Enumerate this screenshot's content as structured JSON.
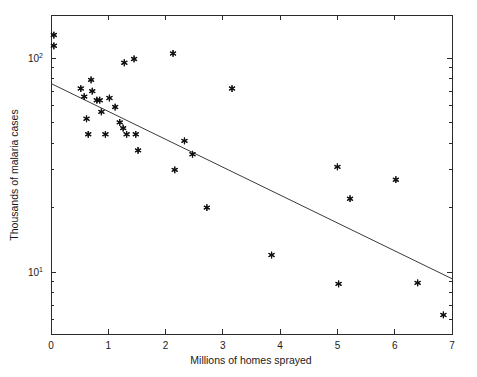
{
  "chart_data": {
    "type": "scatter",
    "title": "",
    "xlabel": "Millions of homes sprayed",
    "ylabel": "Thousands of malaria cases",
    "xlim": [
      0,
      7
    ],
    "ylim": [
      5.5,
      160
    ],
    "yscale": "log",
    "xscale": "linear",
    "grid": false,
    "legend": null,
    "marker_style": "asterisk",
    "xticks": [
      0,
      1,
      2,
      3,
      4,
      5,
      6,
      7
    ],
    "xticklabels": [
      "0",
      "1",
      "2",
      "3",
      "4",
      "5",
      "6",
      "7"
    ],
    "yticks": [
      10,
      100
    ],
    "yticklabels": [
      "10^1",
      "10^2"
    ],
    "ytick_mantissa": [
      "10",
      "10"
    ],
    "ytick_exponent": [
      "1",
      "2"
    ],
    "points": [
      {
        "x": 0.05,
        "y": 128.0
      },
      {
        "x": 0.05,
        "y": 114.0
      },
      {
        "x": 0.52,
        "y": 72.0
      },
      {
        "x": 0.58,
        "y": 66.0
      },
      {
        "x": 0.62,
        "y": 52.0
      },
      {
        "x": 0.65,
        "y": 44.0
      },
      {
        "x": 0.7,
        "y": 79.0
      },
      {
        "x": 0.72,
        "y": 70.0
      },
      {
        "x": 0.8,
        "y": 63.5
      },
      {
        "x": 0.85,
        "y": 63.5
      },
      {
        "x": 0.88,
        "y": 56.0
      },
      {
        "x": 0.95,
        "y": 44.0
      },
      {
        "x": 1.02,
        "y": 65.0
      },
      {
        "x": 1.12,
        "y": 59.0
      },
      {
        "x": 1.2,
        "y": 50.0
      },
      {
        "x": 1.26,
        "y": 47.0
      },
      {
        "x": 1.28,
        "y": 95.0
      },
      {
        "x": 1.32,
        "y": 44.0
      },
      {
        "x": 1.45,
        "y": 99.0
      },
      {
        "x": 1.48,
        "y": 44.0
      },
      {
        "x": 1.52,
        "y": 37.0
      },
      {
        "x": 2.13,
        "y": 105.0
      },
      {
        "x": 2.16,
        "y": 30.0
      },
      {
        "x": 2.33,
        "y": 41.0
      },
      {
        "x": 2.47,
        "y": 35.5
      },
      {
        "x": 2.72,
        "y": 20.0
      },
      {
        "x": 3.16,
        "y": 72.0
      },
      {
        "x": 3.85,
        "y": 12.0
      },
      {
        "x": 5.0,
        "y": 31.0
      },
      {
        "x": 5.02,
        "y": 8.8
      },
      {
        "x": 5.22,
        "y": 22.0
      },
      {
        "x": 6.02,
        "y": 27.0
      },
      {
        "x": 6.4,
        "y": 8.9
      },
      {
        "x": 6.85,
        "y": 6.3
      }
    ],
    "trendline": {
      "x0": 0,
      "y0": 76.0,
      "x1": 7,
      "y1": 9.3
    }
  }
}
